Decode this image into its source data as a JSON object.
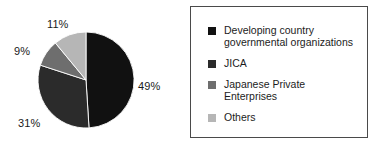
{
  "chart_data": {
    "type": "pie",
    "title": "",
    "subtitle": "",
    "xlabel": "",
    "ylabel": "",
    "categories": [
      "Developing country governmental  organizations",
      "JICA",
      "Japanese Private Enterprises",
      "Others"
    ],
    "values": [
      49,
      31,
      9,
      11
    ],
    "value_labels": [
      "49%",
      "31%",
      "9%",
      "11%"
    ],
    "colors": [
      "#111111",
      "#2b2b2b",
      "#6e6e6e",
      "#b6b6b6"
    ],
    "units": "percent",
    "start_angle_deg": 0,
    "direction": "clockwise",
    "legend_position": "right",
    "legend_border": true,
    "grid": false
  },
  "pie": {
    "labels": [
      {
        "text": "49%"
      },
      {
        "text": "31%"
      },
      {
        "text": "9%"
      },
      {
        "text": "11%"
      }
    ]
  },
  "legend": {
    "items": [
      {
        "label": "Developing country\ngovernmental  organizations",
        "color": "#111111",
        "swatch_name": "legend-swatch-developing-country-governmental-organizations"
      },
      {
        "label": "JICA",
        "color": "#2b2b2b",
        "swatch_name": "legend-swatch-jica"
      },
      {
        "label": "Japanese Private\n Enterprises",
        "color": "#6e6e6e",
        "swatch_name": "legend-swatch-japanese-private-enterprises"
      },
      {
        "label": "Others",
        "color": "#b6b6b6",
        "swatch_name": "legend-swatch-others"
      }
    ]
  }
}
